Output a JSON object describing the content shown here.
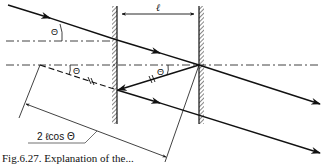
{
  "diagram": {
    "labels": {
      "spacing": "ℓ",
      "angle_incident": "Θ",
      "angle_lower": "Θ",
      "angle_reflected": "Θ",
      "path_difference": "2 ℓcos Θ"
    },
    "caption": "Fig.6.27. Explanation of the...",
    "colors": {
      "line": "#111111",
      "hatch": "#555555",
      "background": "#ffffff"
    }
  }
}
